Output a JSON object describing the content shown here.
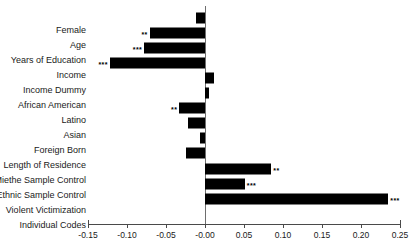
{
  "chart_data": {
    "type": "bar",
    "orientation": "horizontal",
    "title": "",
    "xlabel": "",
    "ylabel": "",
    "xlim": [
      -0.15,
      0.25
    ],
    "grid": false,
    "legend": null,
    "xticks": [
      -0.15,
      -0.1,
      -0.05,
      -0.0,
      0.05,
      0.1,
      0.15,
      0.2,
      0.25
    ],
    "xticklabels": [
      "-0.15",
      "-0.10",
      "-0.05",
      "-0.00",
      "0.05",
      "0.10",
      "0.15",
      "0.20",
      "0.25"
    ],
    "bar_color": "#000000",
    "zero_line_color": "#6e6e6e",
    "categories": [
      "Female",
      "Age",
      "Years of Education",
      "Income",
      "Income Dummy",
      "African American",
      "Latino",
      "Asian",
      "Foreign Born",
      "Length of Residence",
      "Miethe Sample Control",
      "Ethnic Sample Control",
      "Violent Victimization",
      "Individual Codes"
    ],
    "values": [
      -0.011,
      -0.071,
      -0.078,
      -0.122,
      0.012,
      0.005,
      -0.033,
      -0.022,
      -0.006,
      -0.025,
      0.085,
      0.051,
      0.235,
      null
    ],
    "significance": [
      "",
      "**",
      "***",
      "***",
      "",
      "",
      "**",
      "",
      "",
      "",
      "**",
      "***",
      "***",
      ""
    ]
  }
}
